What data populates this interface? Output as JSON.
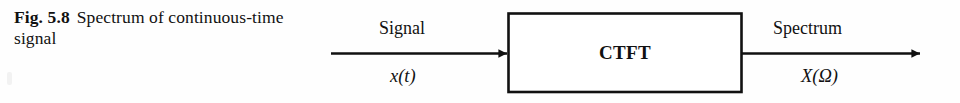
{
  "figure": {
    "caption": {
      "label": "Fig. 5.8",
      "text": "Spectrum of continuous-time signal"
    },
    "diagram": {
      "type": "block-diagram",
      "block": {
        "name": "CTFT",
        "label": "CTFT"
      },
      "input": {
        "arrow_label_top": "Signal",
        "arrow_label_bottom": "x(t)",
        "direction": "right"
      },
      "output": {
        "arrow_label_top": "Spectrum",
        "arrow_label_bottom": "X(Ω)",
        "direction": "right"
      },
      "colors": {
        "stroke": "#111111",
        "background": "#fefefe",
        "text": "#111111"
      }
    }
  }
}
